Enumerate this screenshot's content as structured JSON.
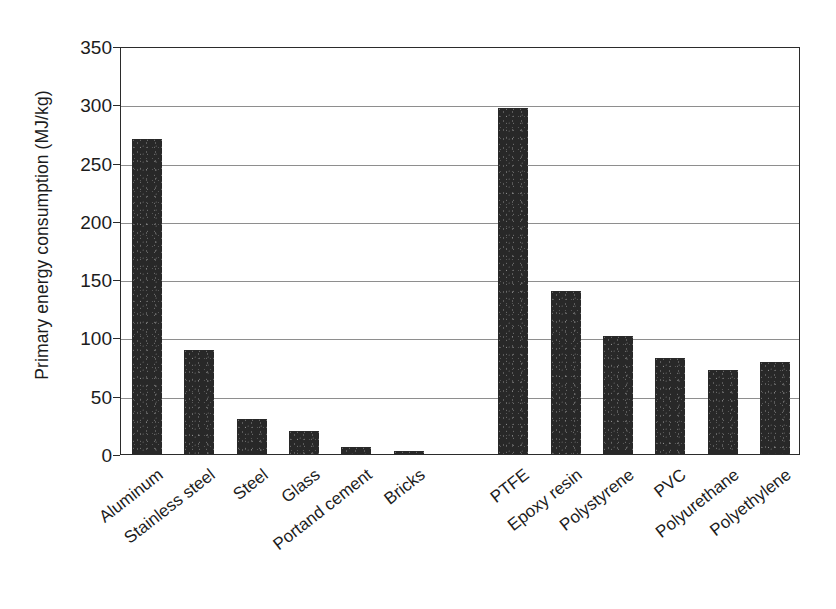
{
  "chart_data": {
    "type": "bar",
    "title": "",
    "xlabel": "",
    "ylabel": "Primary energy consumption (MJ/kg)",
    "ylim": [
      0,
      350
    ],
    "yticks": [
      0,
      50,
      100,
      150,
      200,
      250,
      300,
      350
    ],
    "grid": true,
    "legend": "none",
    "bar_color": "#282828",
    "axis_color": "#2b2b2b",
    "gridline_color": "#8e8e8e",
    "background_color": "#ffffff",
    "label_rotation_deg": -38,
    "categories": [
      "Aluminum",
      "Stainless steel",
      "Steel",
      "Glass",
      "Portand cement",
      "Bricks",
      "",
      "PTFE",
      "Epoxy resin",
      "Polystyrene",
      "PVC",
      "Polyurethane",
      "Polyethylene"
    ],
    "values": [
      270,
      89,
      30,
      20,
      6,
      3,
      null,
      297,
      140,
      101,
      82,
      72,
      79
    ],
    "groups": [
      {
        "name": "metals-and-minerals",
        "categories": [
          "Aluminum",
          "Stainless steel",
          "Steel",
          "Glass",
          "Portand cement",
          "Bricks"
        ],
        "values": [
          270,
          89,
          30,
          20,
          6,
          3
        ]
      },
      {
        "name": "polymers",
        "categories": [
          "PTFE",
          "Epoxy resin",
          "Polystyrene",
          "PVC",
          "Polyurethane",
          "Polyethylene"
        ],
        "values": [
          297,
          140,
          101,
          82,
          72,
          79
        ]
      }
    ]
  }
}
